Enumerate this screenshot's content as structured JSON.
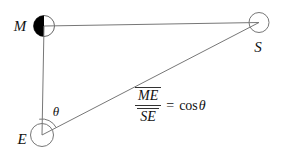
{
  "diagram": {
    "point_labels": {
      "moon": "M",
      "earth": "E",
      "sun": "S"
    },
    "angle_label": "θ",
    "formula": {
      "numerator": "ME",
      "denominator": "SE",
      "equals": "=",
      "function": "cos",
      "angle": "θ"
    },
    "colors": {
      "line": "#777777",
      "text": "#111111",
      "moon_fill": "#000000",
      "background": "#ffffff"
    }
  }
}
